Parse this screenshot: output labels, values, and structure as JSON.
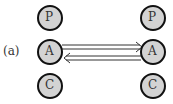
{
  "figure": {
    "panel_label": "(a)",
    "left_column": {
      "top": "P",
      "middle": "A",
      "bottom": "C"
    },
    "right_column": {
      "top": "P",
      "middle": "A",
      "bottom": "C"
    },
    "arrows": [
      {
        "from": "left.A",
        "to": "right.A",
        "style": "double-line open arrow"
      },
      {
        "from": "right.A",
        "to": "left.A",
        "style": "double-line open arrow"
      }
    ]
  },
  "colors": {
    "node_fill": "#d3d3d3",
    "node_stroke": "#111111",
    "arrow": "#333333"
  }
}
